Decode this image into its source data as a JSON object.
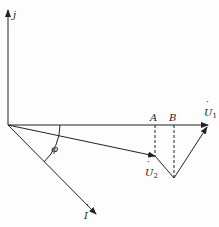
{
  "diagram": {
    "type": "phasor diagram",
    "axis": {
      "label": "j"
    },
    "points": {
      "A": {
        "label": "A"
      },
      "B": {
        "label": "B"
      }
    },
    "phasors": {
      "U1": {
        "symbol": "U",
        "subscript": "1"
      },
      "U2": {
        "symbol": "U",
        "subscript": "2"
      },
      "I": {
        "symbol": "I"
      }
    },
    "angle": {
      "label": "φ"
    }
  }
}
